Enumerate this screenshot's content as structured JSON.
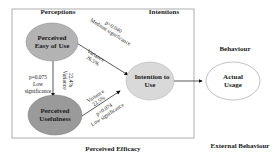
{
  "sections": {
    "perceptions": "Perceptions",
    "intentions": "Intentions",
    "behaviour": "Behaviour",
    "perceived_efficacy": "Perceived Efficacy",
    "external_behaviour": "External Behaviour"
  },
  "nodes": {
    "peou": {
      "line1": "Perceived",
      "line2": "Easy of Use",
      "fill": "#b3b3b3"
    },
    "pu": {
      "line1": "Perceived",
      "line2": "Usefulness",
      "fill": "#9a9a9a"
    },
    "itu": {
      "line1": "Intention to",
      "line2": "Use",
      "fill": "#d9d9d9"
    },
    "au": {
      "line1": "Actual",
      "line2": "Usage",
      "fill": "#ffffff"
    }
  },
  "edges": {
    "peou_itu": {
      "p": "p=0.040",
      "significance": "Medium significance",
      "variance_label": "Variance",
      "variance": "26.5%"
    },
    "peou_pu": {
      "p": "p=0.075",
      "significance_1": "Low",
      "significance_2": "significance",
      "variance_label": "Variance",
      "variance": "22.4%"
    },
    "pu_itu": {
      "variance_label": "Variance",
      "variance": "22.5%",
      "p": "p=0.074",
      "significance": "Low significance"
    }
  }
}
